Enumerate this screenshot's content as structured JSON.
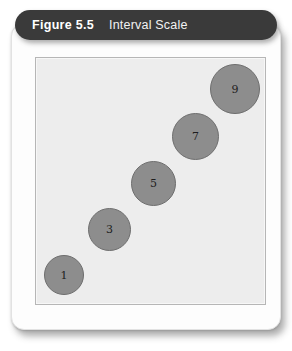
{
  "figure": {
    "number_label": "Figure 5.5",
    "caption": "Interval Scale"
  },
  "colors": {
    "header_bar": "#3a3a3a",
    "card": "#fdfdfd",
    "plot_background": "#ededed",
    "plot_border": "#b6b6b6",
    "circle_fill": "#8d8d8d",
    "circle_stroke": "#6e6e6e",
    "label_text": "#1d1d1d",
    "header_text": "#ffffff"
  },
  "chart_data": {
    "type": "scatter",
    "title": "Interval Scale",
    "xlabel": "",
    "ylabel": "",
    "grid": false,
    "legend": "none",
    "axis_ticks": "none",
    "point_labels": [
      "1",
      "3",
      "5",
      "7",
      "9"
    ],
    "values": [
      1,
      3,
      5,
      7,
      9
    ],
    "points": [
      {
        "label": "1",
        "x": 44,
        "y": 255,
        "diameter": 40
      },
      {
        "label": "3",
        "x": 88,
        "y": 208,
        "diameter": 43
      },
      {
        "label": "5",
        "x": 131,
        "y": 161,
        "diameter": 45
      },
      {
        "label": "7",
        "x": 172,
        "y": 113,
        "diameter": 47
      },
      {
        "label": "9",
        "x": 210,
        "y": 64,
        "diameter": 50
      }
    ]
  }
}
